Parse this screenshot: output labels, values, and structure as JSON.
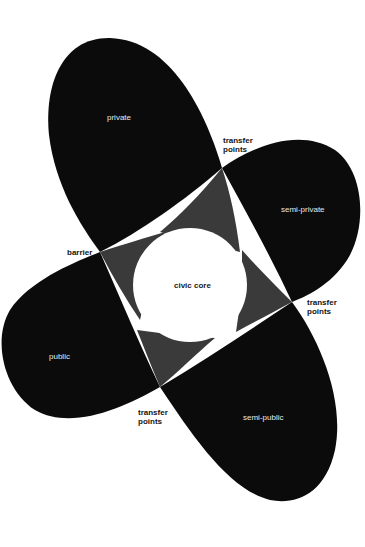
{
  "diagram": {
    "colors": {
      "background": "#ffffff",
      "petal": "#0b0b0b",
      "overlap": "#3a3a3a",
      "core": "#ffffff"
    },
    "core": {
      "label": "civic core"
    },
    "petals": [
      {
        "id": "private",
        "label": "private"
      },
      {
        "id": "semi-private",
        "label": "semi-private"
      },
      {
        "id": "public",
        "label": "public"
      },
      {
        "id": "semi-public",
        "label": "semi-public"
      }
    ],
    "annotations": [
      {
        "id": "transfer-top",
        "label": "transfer\npoints"
      },
      {
        "id": "transfer-right",
        "label": "transfer\npoints"
      },
      {
        "id": "transfer-bottom",
        "label": "transfer\npoints"
      },
      {
        "id": "barrier",
        "label": "barrier"
      }
    ]
  }
}
